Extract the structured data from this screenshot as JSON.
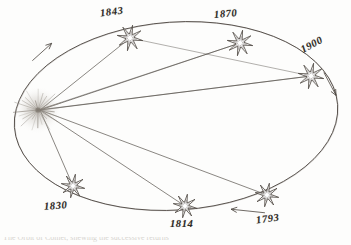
{
  "figure": {
    "background_color": "#fdfdfc",
    "ink_color": "#4a443e",
    "label_color": "#2e2a26",
    "caption_partial": "The Orbit of Comet, shewing the successive returns"
  },
  "sun": {
    "name": "sun-starburst",
    "cx": 38,
    "cy": 110,
    "ray_count": 26,
    "ray_length": 26,
    "color": "#8d877f"
  },
  "orbit": {
    "type": "ellipse",
    "cx": 176,
    "cy": 116,
    "rx": 162,
    "ry": 94,
    "rotation_deg": -4,
    "stroke": "#4a443e",
    "stroke_width": 0.9
  },
  "arrows": [
    {
      "name": "orbit-direction-arrow-upper-left",
      "x": 42,
      "y": 52,
      "angle_deg": -42,
      "length": 26,
      "label": "direction of motion"
    },
    {
      "name": "orbit-direction-arrow-right",
      "x": 330,
      "y": 84,
      "angle_deg": 62,
      "length": 26,
      "label": "direction of motion"
    },
    {
      "name": "orbit-direction-arrow-bottom",
      "x": 248,
      "y": 211,
      "angle_deg": 186,
      "length": 34,
      "label": "direction of motion"
    }
  ],
  "positions": [
    {
      "year": "1843",
      "star_x": 130,
      "star_y": 38,
      "label_x": 100,
      "label_y": 6,
      "label_rotation": -7,
      "star_radius": 13,
      "points": 8
    },
    {
      "year": "1870",
      "star_x": 240,
      "star_y": 43,
      "label_x": 214,
      "label_y": 8,
      "label_rotation": -5,
      "star_radius": 13,
      "points": 8
    },
    {
      "year": "1900",
      "star_x": 311,
      "star_y": 76,
      "label_x": 300,
      "label_y": 39,
      "label_rotation": -28,
      "star_radius": 13,
      "points": 8
    },
    {
      "year": "1793",
      "star_x": 267,
      "star_y": 195,
      "label_x": 256,
      "label_y": 213,
      "label_rotation": -8,
      "star_radius": 12,
      "points": 8
    },
    {
      "year": "1814",
      "star_x": 185,
      "star_y": 206,
      "label_x": 170,
      "label_y": 218,
      "label_rotation": 0,
      "star_radius": 12,
      "points": 8
    },
    {
      "year": "1830",
      "star_x": 73,
      "star_y": 186,
      "label_x": 44,
      "label_y": 200,
      "label_rotation": -4,
      "star_radius": 12,
      "points": 8
    }
  ],
  "chart_data": {
    "type": "scatter",
    "xlabel": "",
    "ylabel": "",
    "categories": [
      "1793",
      "1814",
      "1830",
      "1843",
      "1870",
      "1900"
    ],
    "values": [
      1793,
      1814,
      1830,
      1843,
      1870,
      1900
    ],
    "annotations": [
      "Sun at the left focus of the ellipse",
      "Radius vectors drawn from Sun to each dated comet position",
      "Arrows indicate direction of orbital motion"
    ],
    "legend_position": "none",
    "grid": false
  }
}
